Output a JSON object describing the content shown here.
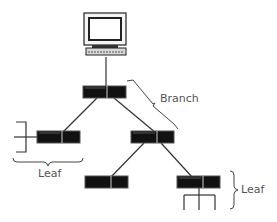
{
  "diagram": {
    "type": "tree-topology",
    "nodes": [
      {
        "id": "root-computer",
        "kind": "computer",
        "role": "root"
      },
      {
        "id": "hub-top",
        "kind": "hub",
        "role": "branch"
      },
      {
        "id": "hub-left",
        "kind": "hub",
        "role": "leaf"
      },
      {
        "id": "hub-middle",
        "kind": "hub",
        "role": "branch"
      },
      {
        "id": "hub-bottom-left",
        "kind": "hub",
        "role": "leaf"
      },
      {
        "id": "hub-bottom-right",
        "kind": "hub",
        "role": "leaf"
      }
    ],
    "edges": [
      [
        "root-computer",
        "hub-top"
      ],
      [
        "hub-top",
        "hub-left"
      ],
      [
        "hub-top",
        "hub-middle"
      ],
      [
        "hub-middle",
        "hub-bottom-left"
      ],
      [
        "hub-middle",
        "hub-bottom-right"
      ]
    ],
    "labels": {
      "branch": "Branch",
      "leaf_left": "Leaf",
      "leaf_right": "Leaf"
    },
    "colors": {
      "line": "#333333",
      "hub_fill": "#111111",
      "label_text": "#555555",
      "background": "#ffffff"
    }
  }
}
